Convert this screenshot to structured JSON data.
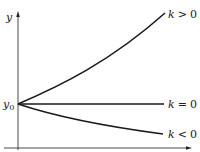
{
  "figure": {
    "type": "diagram",
    "axes": {
      "y_label": "y",
      "origin_label_base": "y",
      "origin_label_sub": "0"
    },
    "curves": [
      {
        "id": "growth",
        "label_var": "k",
        "label_rel": ">",
        "label_val": "0",
        "label": "k > 0"
      },
      {
        "id": "constant",
        "label_var": "k",
        "label_rel": "=",
        "label_val": "0",
        "label": "k = 0"
      },
      {
        "id": "decay",
        "label_var": "k",
        "label_rel": "<",
        "label_val": "0",
        "label": "k < 0"
      }
    ],
    "colors": {
      "curve": "#1a1a1a",
      "axis": "#333333",
      "text": "#222222"
    }
  }
}
